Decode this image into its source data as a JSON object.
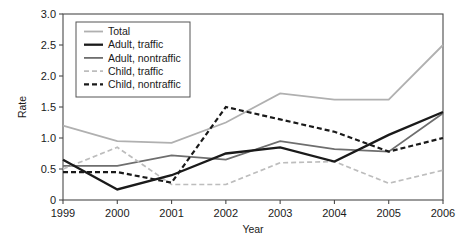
{
  "chart_data": {
    "type": "line",
    "title": "",
    "xlabel": "Year",
    "ylabel": "Rate",
    "x": [
      1999,
      2000,
      2001,
      2002,
      2003,
      2004,
      2005,
      2006
    ],
    "xtick_labels": [
      "1999",
      "2000",
      "2001",
      "2002",
      "2003",
      "2004",
      "2005",
      "2006"
    ],
    "ytick_labels": [
      "0",
      "0.5",
      "1.0",
      "1.5",
      "2.0",
      "2.5",
      "3.0"
    ],
    "ytick_values": [
      0,
      0.5,
      1.0,
      1.5,
      2.0,
      2.5,
      3.0
    ],
    "xlim": [
      1999,
      2006
    ],
    "ylim": [
      0,
      3.0
    ],
    "grid": false,
    "legend_position": "upper-left",
    "series": [
      {
        "name": "Total",
        "values": [
          1.2,
          0.95,
          0.92,
          1.25,
          1.72,
          1.62,
          1.62,
          2.5
        ],
        "color": "#b0b0b0",
        "width": 1.8,
        "dash": "none"
      },
      {
        "name": "Adult, traffic",
        "values": [
          0.65,
          0.17,
          0.4,
          0.75,
          0.85,
          0.62,
          1.05,
          1.42
        ],
        "color": "#1a1a1a",
        "width": 2.3,
        "dash": "none"
      },
      {
        "name": "Adult, nontraffic",
        "values": [
          0.55,
          0.55,
          0.72,
          0.65,
          0.95,
          0.82,
          0.78,
          1.4
        ],
        "color": "#6e6e6e",
        "width": 1.8,
        "dash": "none"
      },
      {
        "name": "Child, traffic",
        "values": [
          0.5,
          0.85,
          0.25,
          0.25,
          0.6,
          0.62,
          0.27,
          0.48
        ],
        "color": "#bdbdbd",
        "width": 1.7,
        "dash": "5,3"
      },
      {
        "name": "Child, nontraffic",
        "values": [
          0.45,
          0.45,
          0.28,
          1.5,
          1.3,
          1.1,
          0.78,
          1.0
        ],
        "color": "#1a1a1a",
        "width": 2.2,
        "dash": "5,3"
      }
    ]
  }
}
